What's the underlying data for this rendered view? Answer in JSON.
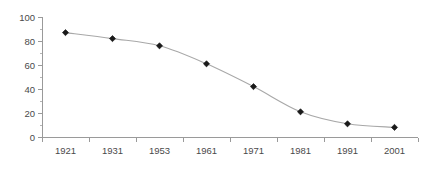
{
  "chart_data": {
    "type": "line",
    "title": "",
    "subtitle": "",
    "xlabel": "",
    "ylabel": "",
    "categories": [
      "1921",
      "1931",
      "1953",
      "1961",
      "1971",
      "1981",
      "1991",
      "2001"
    ],
    "series": [
      {
        "name": "series-1",
        "values": [
          87,
          82,
          76,
          61,
          42,
          21,
          11,
          8
        ],
        "marker": "diamond",
        "marker_color": "#1a1a1a",
        "line_color": "#a8a8a8"
      }
    ],
    "ylim": [
      0,
      100
    ],
    "y_ticks": [
      0,
      20,
      40,
      60,
      80,
      100
    ],
    "y_tick_labels": [
      "0",
      "20",
      "40",
      "60",
      "80",
      "100"
    ],
    "y_minor_ticks": [
      10,
      30,
      50,
      70,
      90
    ],
    "grid": false,
    "legend": "none",
    "axis_color": "#9a9a9a",
    "label_color": "#4a4a4a",
    "background": "#ffffff"
  },
  "layout": {
    "plot_left": 42,
    "plot_right": 418,
    "plot_top": 17,
    "plot_bottom": 137,
    "width": 437,
    "height": 172
  }
}
